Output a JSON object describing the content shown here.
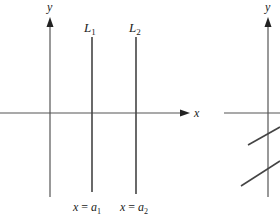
{
  "left_panel": {
    "y_axis_label": "y",
    "x_axis_label": "x",
    "line1": {
      "name": "L",
      "subscript": "1",
      "equation_lhs": "x = ",
      "equation_var": "a",
      "equation_sub": "1"
    },
    "line2": {
      "name": "L",
      "subscript": "2",
      "equation_lhs": "x = ",
      "equation_var": "a",
      "equation_sub": "2"
    }
  },
  "right_panel": {
    "y_axis_label": "y"
  },
  "colors": {
    "line": "#444444",
    "text": "#222222",
    "background": "#ffffff"
  }
}
